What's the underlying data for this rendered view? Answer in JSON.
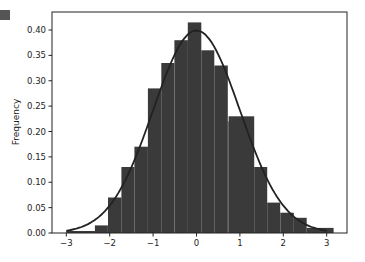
{
  "chart_data": {
    "type": "bar",
    "subtype": "histogram-with-density-curve",
    "title": "",
    "xlabel": "",
    "ylabel": "Frequency",
    "xlim": [
      -3.3,
      3.5
    ],
    "ylim": [
      0,
      0.435
    ],
    "grid": false,
    "legend": null,
    "x_ticks": [
      -3,
      -2,
      -1,
      0,
      1,
      2,
      3
    ],
    "x_tick_labels": [
      "−3",
      "−2",
      "−1",
      "0",
      "1",
      "2",
      "3"
    ],
    "y_ticks": [
      0.0,
      0.05,
      0.1,
      0.15,
      0.2,
      0.25,
      0.3,
      0.35,
      0.4
    ],
    "y_tick_labels": [
      "0.00",
      "0.05",
      "0.10",
      "0.15",
      "0.20",
      "0.25",
      "0.30",
      "0.35",
      "0.40"
    ],
    "bins": [
      {
        "x0": -3.0,
        "x1": -2.34,
        "value": 0.004
      },
      {
        "x0": -2.34,
        "x1": -2.04,
        "value": 0.015
      },
      {
        "x0": -2.04,
        "x1": -1.73,
        "value": 0.07
      },
      {
        "x0": -1.73,
        "x1": -1.43,
        "value": 0.13
      },
      {
        "x0": -1.43,
        "x1": -1.12,
        "value": 0.17
      },
      {
        "x0": -1.12,
        "x1": -0.81,
        "value": 0.285
      },
      {
        "x0": -0.81,
        "x1": -0.51,
        "value": 0.335
      },
      {
        "x0": -0.51,
        "x1": -0.2,
        "value": 0.38
      },
      {
        "x0": -0.2,
        "x1": 0.11,
        "value": 0.415
      },
      {
        "x0": 0.11,
        "x1": 0.41,
        "value": 0.36
      },
      {
        "x0": 0.41,
        "x1": 0.72,
        "value": 0.33
      },
      {
        "x0": 0.72,
        "x1": 0.74,
        "value": 0.22
      },
      {
        "x0": 0.74,
        "x1": 1.33,
        "value": 0.23
      },
      {
        "x0": 1.33,
        "x1": 1.63,
        "value": 0.13
      },
      {
        "x0": 1.63,
        "x1": 1.93,
        "value": 0.06
      },
      {
        "x0": 1.93,
        "x1": 2.24,
        "value": 0.04
      },
      {
        "x0": 2.24,
        "x1": 2.54,
        "value": 0.03
      },
      {
        "x0": 2.54,
        "x1": 3.16,
        "value": 0.01
      }
    ],
    "series": [
      {
        "name": "histogram",
        "kind": "bar",
        "color": "#3a3a3a"
      },
      {
        "name": "normal-pdf",
        "kind": "line",
        "color": "#222222",
        "mean": 0,
        "std": 1,
        "x_range": [
          -3,
          3
        ]
      }
    ]
  },
  "colors": {
    "bar": "#3a3a3a",
    "curve": "#222222",
    "axis": "#222222",
    "background": "#ffffff",
    "corner_badge": "#555555"
  }
}
